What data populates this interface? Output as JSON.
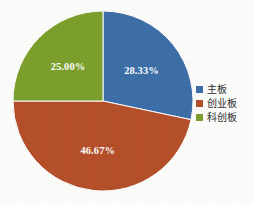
{
  "chart_data": {
    "type": "pie",
    "title": "",
    "categories": [
      "主板",
      "创业板",
      "科创板"
    ],
    "values": [
      28.33,
      46.67,
      25.0
    ],
    "data_labels": [
      "28.33%",
      "46.67%",
      "25.00%"
    ],
    "colors": [
      "#3d6fa8",
      "#b5502a",
      "#7ca02c"
    ],
    "legend_position": "right",
    "start_angle_deg": 0,
    "direction": "clockwise",
    "units": "%",
    "grid": false,
    "xlabel": "",
    "ylabel": ""
  },
  "slices": [
    {
      "name": "主板",
      "label": "28.33%",
      "value": 28.33,
      "color": "#3d6fa8"
    },
    {
      "name": "创业板",
      "label": "46.67%",
      "value": 46.67,
      "color": "#b5502a"
    },
    {
      "name": "科创板",
      "label": "25.00%",
      "value": 25.0,
      "color": "#7ca02c"
    }
  ],
  "legend": {
    "items": [
      {
        "label": "主板",
        "color": "#3d6fa8"
      },
      {
        "label": "创业板",
        "color": "#b5502a"
      },
      {
        "label": "科创板",
        "color": "#7ca02c"
      }
    ]
  },
  "geometry": {
    "center_x": 103,
    "center_y": 101,
    "radius": 90
  },
  "palette": {
    "background": "#ffffff",
    "label_text": "#ffffff",
    "legend_text": "#2b2b2b",
    "slice_divider": "#ffffff"
  }
}
